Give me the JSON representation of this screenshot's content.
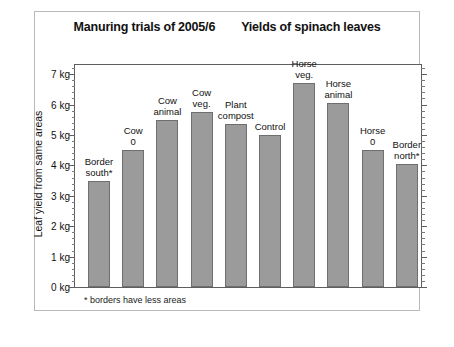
{
  "titles": {
    "left": "Manuring trials of 2005/6",
    "right": "Yields of spinach leaves"
  },
  "footnote": "* borders have less areas",
  "axis": {
    "y_title": "Leaf yield from same areas",
    "y_ticks": [
      "0 kg",
      "1 kg",
      "2 kg",
      "3 kg",
      "4 kg",
      "5 kg",
      "6 kg",
      "7 kg"
    ]
  },
  "chart_data": {
    "type": "bar",
    "xlabel": "",
    "ylabel": "Leaf yield from same areas",
    "ylim": [
      0,
      7.3
    ],
    "y_unit": "kg",
    "grid": false,
    "legend": null,
    "annotations": [
      "* borders have less areas"
    ],
    "categories": [
      "Border south*",
      "Cow 0",
      "Cow animal",
      "Cow veg.",
      "Plant compost",
      "Control",
      "Horse veg.",
      "Horse animal",
      "Horse 0",
      "Border north*"
    ],
    "category_lines": [
      [
        "Border",
        "south*"
      ],
      [
        "Cow",
        "0"
      ],
      [
        "Cow",
        "animal"
      ],
      [
        "Cow",
        "veg."
      ],
      [
        "Plant",
        "compost"
      ],
      [
        "Control"
      ],
      [
        "Horse",
        "veg."
      ],
      [
        "Horse",
        "animal"
      ],
      [
        "Horse",
        "0"
      ],
      [
        "Border",
        "north*"
      ]
    ],
    "values": [
      3.5,
      4.5,
      5.5,
      5.75,
      5.35,
      5.0,
      6.7,
      6.05,
      4.5,
      4.05
    ],
    "bar_color": "#9b9b9b",
    "bar_edge_color": "#6f6f6f"
  }
}
